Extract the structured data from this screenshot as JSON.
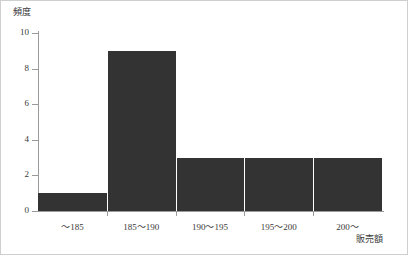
{
  "chart_data": {
    "type": "bar",
    "title": "",
    "subtitle": "",
    "xlabel": "販売額",
    "ylabel": "頻度",
    "categories": [
      "～185",
      "185～190",
      "190～195",
      "195～200",
      "200～"
    ],
    "values": [
      1,
      9,
      3,
      3,
      3
    ],
    "series": [
      {
        "name": "頻度",
        "values": [
          1,
          9,
          3,
          3,
          3
        ]
      }
    ],
    "ylim": [
      0,
      10
    ],
    "ytick_labels": [
      "0",
      "2",
      "4",
      "6",
      "8",
      "10"
    ],
    "ytick_values": [
      0,
      2,
      4,
      6,
      8,
      10
    ],
    "grid": false,
    "legend": false,
    "legend_position": "none",
    "bar_color": "#333333",
    "axis_color": "#9a9a9a",
    "text_color": "#3a3a3a",
    "background_color": "#ffffff",
    "border_color": "#cfcfcf",
    "annotations": []
  }
}
